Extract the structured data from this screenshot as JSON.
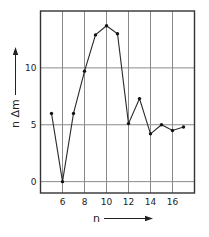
{
  "chart_data": {
    "type": "line",
    "title": "",
    "xlabel": "n",
    "ylabel": "n Δm",
    "xlim": [
      4,
      18
    ],
    "ylim": [
      -1,
      15
    ],
    "grid": true,
    "legend": null,
    "x_ticks": [
      6,
      8,
      10,
      12,
      14,
      16
    ],
    "x_tick_labels": [
      "6",
      "8",
      "10",
      "12",
      "14",
      "16"
    ],
    "x_gridlines": [
      5,
      6,
      7,
      8,
      9,
      10,
      11,
      12,
      13,
      14,
      15,
      16,
      17
    ],
    "y_ticks": [
      0,
      5,
      10
    ],
    "y_tick_labels": [
      "0",
      "5",
      "10"
    ],
    "series": [
      {
        "name": "nΔm",
        "x": [
          5,
          6,
          7,
          8,
          9,
          10,
          11,
          12,
          13,
          14,
          15,
          16,
          17
        ],
        "values": [
          6.0,
          0.0,
          6.0,
          9.7,
          12.9,
          13.7,
          13.0,
          5.1,
          7.3,
          4.2,
          5.0,
          4.5,
          4.8
        ]
      }
    ]
  }
}
